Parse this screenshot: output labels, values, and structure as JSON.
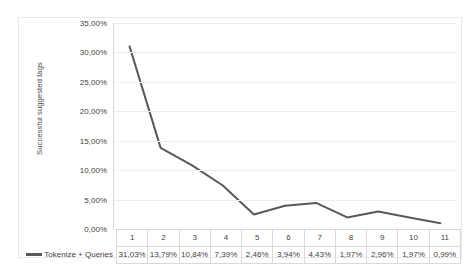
{
  "chart_data": {
    "type": "line",
    "title": "",
    "xlabel": "",
    "ylabel": "Successful suggested tags",
    "categories": [
      "1",
      "2",
      "3",
      "4",
      "5",
      "6",
      "7",
      "8",
      "9",
      "10",
      "11"
    ],
    "series": [
      {
        "name": "Tokenize + Queries",
        "values": [
          31.03,
          13.79,
          10.84,
          7.39,
          2.46,
          3.94,
          4.43,
          1.97,
          2.96,
          1.97,
          0.99
        ],
        "value_labels": [
          "31,03%",
          "13,79%",
          "10,84%",
          "7,39%",
          "2,46%",
          "3,94%",
          "4,43%",
          "1,97%",
          "2,96%",
          "1,97%",
          "0,99%"
        ],
        "color": "#595959"
      }
    ],
    "ylim": [
      0,
      35
    ],
    "ytick_values": [
      0,
      5,
      10,
      15,
      20,
      25,
      30,
      35
    ],
    "ytick_labels": [
      "0,00%",
      "5,00%",
      "10,00%",
      "15,00%",
      "20,00%",
      "25,00%",
      "30,00%",
      "35,00%"
    ],
    "grid": "horizontal",
    "legend_position": "data-table-left",
    "has_data_table": true,
    "markers": false
  },
  "colors": {
    "series_line": "#595959",
    "gridline": "#ededed",
    "axis_line": "#d9d9d9",
    "table_border": "#d9d9d9",
    "text": "#3f3f3f",
    "background": "#ffffff",
    "frame": "#e8e8e8"
  }
}
